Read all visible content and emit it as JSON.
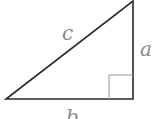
{
  "diagram": {
    "type": "right-triangle",
    "labels": {
      "hypotenuse": "c",
      "vertical_leg": "a",
      "horizontal_leg": "b"
    },
    "right_angle_marker": true,
    "colors": {
      "stroke": "#2a2a2a",
      "marker": "#9a9a9a",
      "label": "#8a8a8a"
    }
  }
}
